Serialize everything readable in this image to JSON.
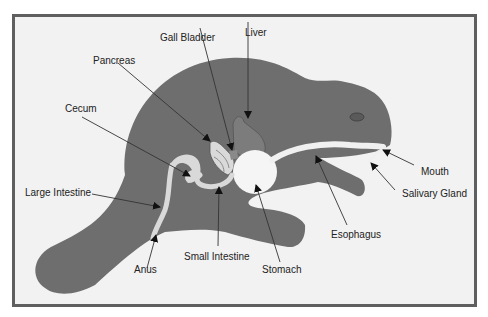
{
  "diagram": {
    "colors": {
      "frame_border": "#5f5f5f",
      "background": "#f2f2f2",
      "body": "#6e6e6e",
      "organ_light": "#d9d9d9",
      "organ_white": "#f5f5f5",
      "label_text": "#222222",
      "leader_line": "#333333"
    },
    "labels": {
      "gall_bladder": "Gall Bladder",
      "liver": "Liver",
      "pancreas": "Pancreas",
      "cecum": "Cecum",
      "large_intestine": "Large Intestine",
      "anus": "Anus",
      "small_intestine": "Small Intestine",
      "stomach": "Stomach",
      "esophagus": "Esophagus",
      "mouth": "Mouth",
      "salivary_gland": "Salivary Gland"
    }
  }
}
